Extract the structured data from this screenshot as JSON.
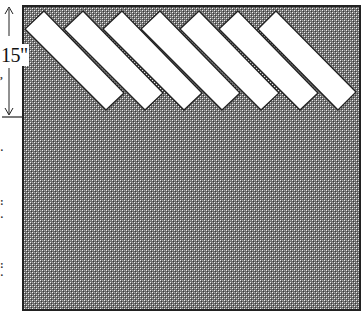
{
  "diagram": {
    "dimension": {
      "label": "15\"",
      "orientation": "vertical",
      "arrow_top_y": 8,
      "arrow_bottom_y": 115,
      "tick_y": 117
    },
    "panel": {
      "x": 23,
      "y": 6,
      "width": 337,
      "height": 304,
      "fill_dark": "#5a5a5a",
      "fill_light": "#b8b8b8",
      "border_color": "#222222"
    },
    "strips": {
      "count": 7,
      "fill": "#ffffff",
      "stroke": "#222222",
      "angle_deg": 45,
      "items": [
        {
          "top": [
            44,
            11
          ],
          "left": [
            25,
            29
          ],
          "bottom": [
            106,
            110
          ],
          "right": [
            124,
            93
          ]
        },
        {
          "top": [
            83,
            11
          ],
          "left": [
            64,
            29
          ],
          "bottom": [
            145,
            110
          ],
          "right": [
            163,
            93
          ]
        },
        {
          "top": [
            122,
            11
          ],
          "left": [
            103,
            29
          ],
          "bottom": [
            184,
            110
          ],
          "right": [
            202,
            93
          ]
        },
        {
          "top": [
            160,
            11
          ],
          "left": [
            141,
            29
          ],
          "bottom": [
            222,
            110
          ],
          "right": [
            240,
            93
          ]
        },
        {
          "top": [
            199,
            11
          ],
          "left": [
            180,
            29
          ],
          "bottom": [
            261,
            110
          ],
          "right": [
            279,
            93
          ]
        },
        {
          "top": [
            238,
            11
          ],
          "left": [
            219,
            29
          ],
          "bottom": [
            300,
            110
          ],
          "right": [
            318,
            93
          ]
        },
        {
          "top": [
            276,
            11
          ],
          "left": [
            258,
            29
          ],
          "bottom": [
            338,
            110
          ],
          "right": [
            356,
            92
          ]
        }
      ]
    },
    "cropped_text_fragments": [
      {
        "text": ",",
        "y": 70
      },
      {
        "text": "·",
        "y": 145
      },
      {
        "text": ":",
        "y": 196
      },
      {
        "text": "·",
        "y": 212
      },
      {
        "text": ":",
        "y": 259
      },
      {
        "text": "·",
        "y": 270
      }
    ]
  }
}
